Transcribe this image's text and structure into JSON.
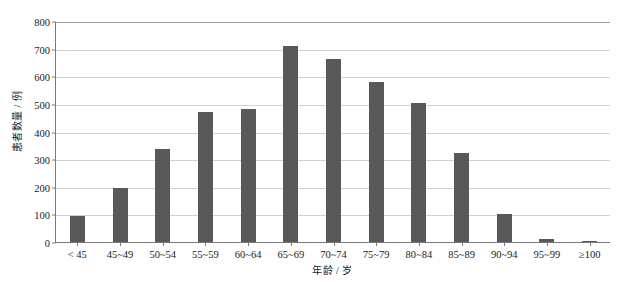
{
  "chart_data": {
    "type": "bar",
    "title": "",
    "xlabel": "年龄 / 岁",
    "ylabel": "患者数量 / 例",
    "categories": [
      "< 45",
      "45~49",
      "50~54",
      "55~59",
      "60~64",
      "65~69",
      "70~74",
      "75~79",
      "80~84",
      "85~89",
      "90~94",
      "95~99",
      "≥100"
    ],
    "values": [
      95,
      197,
      337,
      470,
      482,
      710,
      662,
      578,
      505,
      322,
      103,
      12,
      3
    ],
    "ylim": [
      0,
      800
    ],
    "ytick_step": 100,
    "yticks": [
      0,
      100,
      200,
      300,
      400,
      500,
      600,
      700,
      800
    ],
    "ytick_labels": [
      "0",
      "100",
      "200",
      "300",
      "400",
      "500",
      "600",
      "700",
      "800"
    ],
    "grid": true,
    "grid_axis": "y",
    "legend": false,
    "legend_position": "none",
    "bar_color": "#595959",
    "grid_color": "#d2d2d2",
    "axis_color": "#7a7a7a",
    "background_color": "#ffffff"
  }
}
